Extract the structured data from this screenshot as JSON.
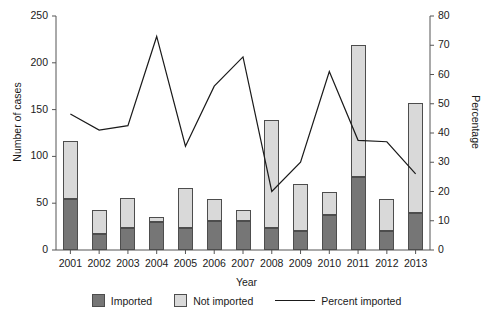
{
  "chart_data": {
    "type": "bar",
    "title": "",
    "xlabel": "Year",
    "ylabel": "Number of cases",
    "y2label": "Percentage",
    "categories": [
      "2001",
      "2002",
      "2003",
      "2004",
      "2005",
      "2006",
      "2007",
      "2008",
      "2009",
      "2010",
      "2011",
      "2012",
      "2013"
    ],
    "ylim": [
      0,
      250
    ],
    "yticks": [
      0,
      50,
      100,
      150,
      200,
      250
    ],
    "y2lim": [
      0,
      80
    ],
    "y2ticks": [
      0,
      10,
      20,
      30,
      40,
      50,
      60,
      70,
      80
    ],
    "grid": false,
    "legend_position": "bottom",
    "series": [
      {
        "name": "Imported",
        "type": "bar",
        "axis": "left",
        "color": "#767676",
        "values": [
          54,
          17,
          24,
          30,
          23,
          31,
          31,
          24,
          20,
          37,
          78,
          20,
          40
        ]
      },
      {
        "name": "Not imported",
        "type": "bar",
        "axis": "left",
        "color": "#d9d9d9",
        "values": [
          62,
          26,
          32,
          5,
          43,
          23,
          12,
          115,
          50,
          25,
          141,
          34,
          117
        ]
      },
      {
        "name": "Percent imported",
        "type": "line",
        "axis": "right",
        "color": "#1a1a1a",
        "values": [
          46.5,
          41,
          42.5,
          73,
          35.5,
          56,
          66,
          20,
          30,
          61,
          37.5,
          37,
          26
        ]
      }
    ],
    "totals": [
      116,
      43,
      56,
      35,
      66,
      54,
      43,
      139,
      70,
      62,
      219,
      54,
      157
    ]
  },
  "legend": {
    "items": [
      {
        "label": "Imported",
        "icon": "dark-square"
      },
      {
        "label": "Not imported",
        "icon": "light-square"
      },
      {
        "label": "Percent imported",
        "icon": "line-segment"
      }
    ]
  }
}
